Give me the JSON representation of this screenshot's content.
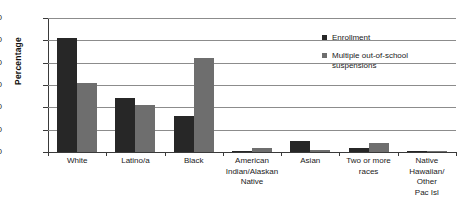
{
  "chart_data": {
    "type": "bar",
    "title": "",
    "xlabel": "",
    "ylabel": "Percentage",
    "ylim": [
      0,
      60
    ],
    "ytick_step": 10,
    "yticks": [
      "60",
      "50",
      "40",
      "30",
      "20",
      "10",
      "0"
    ],
    "grid": true,
    "legend_position": "inside-top-right",
    "categories": [
      "White",
      "Latino/a",
      "Black",
      "American Indian/Alaskan Native",
      "Asian",
      "Two or more races",
      "Native Hawaiian/Other Pac Isl"
    ],
    "category_label_lines": [
      [
        "White"
      ],
      [
        "Latino/a"
      ],
      [
        "Black"
      ],
      [
        "American",
        "Indian/Alaskan",
        "Native"
      ],
      [
        "Asian"
      ],
      [
        "Two or more",
        "races"
      ],
      [
        "Native",
        "Hawaiian/",
        "Other",
        "Pac Isl"
      ]
    ],
    "series": [
      {
        "name": "Enrollment",
        "color": "#272727",
        "values": [
          51,
          24,
          16,
          0.5,
          5,
          2,
          0.3
        ]
      },
      {
        "name": "Multiple out-of-school suspensions",
        "color": "#6e6e6e",
        "values": [
          31,
          21,
          42,
          2,
          1,
          4,
          0.3
        ]
      }
    ]
  },
  "legend": {
    "entries": [
      {
        "label": "Enrollment"
      },
      {
        "label": "Multiple out-of-school suspensions"
      }
    ]
  },
  "colors": {
    "enrollment": "#272727",
    "suspensions": "#6e6e6e",
    "gridline": "#8c8c8c",
    "axis": "#3a3a3a",
    "background": "#ffffff"
  }
}
